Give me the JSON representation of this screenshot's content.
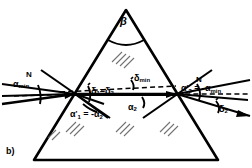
{
  "figure": {
    "panel_label": "b)",
    "caption_type": "prism-minimum-deviation-ray-diagram",
    "colors": {
      "stroke": "#000000",
      "background": "#ffffff"
    }
  },
  "labels": {
    "apex_angle": "β",
    "normal_left": "N",
    "normal_right": "N",
    "incidence_angle_min": {
      "base": "α",
      "sub": "min"
    },
    "deviation_equal": {
      "d1": "δ",
      "s1": "1",
      "eq": "=",
      "d2": "δ",
      "s2": "2"
    },
    "deviation_min": {
      "base": "δ",
      "sub": "min"
    },
    "refraction_internal_1": {
      "base": "α",
      "prime": "'",
      "sub": "1",
      "eq": "= -",
      "rhs_base": "α",
      "rhs_sub": "2"
    },
    "internal_angle_2": {
      "base": "α",
      "sub": "2"
    },
    "exit_angle_2": {
      "base": "α",
      "prime": "'",
      "sub": "2",
      "eq": "= -",
      "rhs_base": "α",
      "rhs_sub": "min"
    },
    "deviation_2": {
      "base": "δ",
      "sub": "2"
    }
  },
  "geometry": {
    "prism": {
      "apex": [
        126,
        10
      ],
      "left_base": [
        34,
        160
      ],
      "right_base": [
        218,
        160
      ]
    },
    "entry_point": [
      75,
      94
    ],
    "exit_point": [
      177,
      94
    ],
    "axis_y": 94,
    "incident_ray_start": [
      2,
      104
    ],
    "exit_ray_end": [
      250,
      116
    ]
  }
}
